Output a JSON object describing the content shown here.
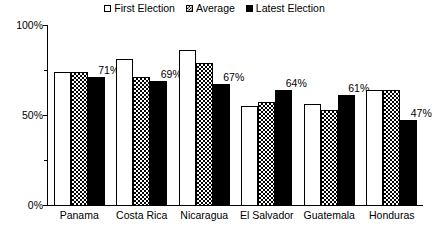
{
  "chart_data": {
    "type": "bar",
    "title": "",
    "subtitle": "",
    "xlabel": "",
    "ylabel": "",
    "ylim": [
      0,
      100
    ],
    "y_ticks": [
      "0%",
      "50%",
      "100%"
    ],
    "y_minor_ticks": [
      25,
      75
    ],
    "grid": false,
    "legend_position": "top-center",
    "categories": [
      "Panama",
      "Costa Rica",
      "Nicaragua",
      "El Salvador",
      "Guatemala",
      "Honduras"
    ],
    "series": [
      {
        "name": "First Election",
        "values": [
          74,
          81,
          86,
          55,
          56,
          64
        ],
        "style": "white"
      },
      {
        "name": "Average",
        "values": [
          74,
          71,
          79,
          57,
          53,
          64
        ],
        "style": "checkered"
      },
      {
        "name": "Latest Election",
        "values": [
          71,
          69,
          67,
          64,
          61,
          47
        ],
        "style": "black"
      }
    ],
    "data_labels": {
      "series": "Latest Election",
      "values": [
        "71%",
        "69%",
        "67%",
        "64%",
        "61%",
        "47%"
      ]
    }
  },
  "legend": {
    "items": [
      {
        "label": "First Election",
        "swatch": "white-square-icon"
      },
      {
        "label": "Average",
        "swatch": "checkered-square-icon"
      },
      {
        "label": "Latest Election",
        "swatch": "black-square-icon"
      }
    ]
  },
  "axis": {
    "y_labels": [
      {
        "text": "100%",
        "value": 100
      },
      {
        "text": "50%",
        "value": 50
      },
      {
        "text": "0%",
        "value": 0
      }
    ]
  },
  "colors": {
    "ink": "#000000",
    "background": "#ffffff"
  }
}
